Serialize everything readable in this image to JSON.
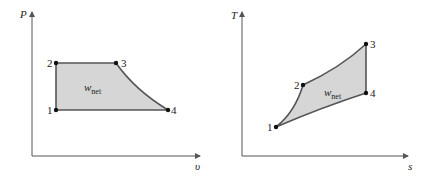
{
  "diagrams": [
    {
      "name": "P-v diagram",
      "y_axis_label": "P",
      "x_axis_label": "υ",
      "area_label": "w",
      "area_label_sub": "net",
      "points": [
        {
          "label": "1"
        },
        {
          "label": "2"
        },
        {
          "label": "3"
        },
        {
          "label": "4"
        }
      ]
    },
    {
      "name": "T-s diagram",
      "y_axis_label": "T",
      "x_axis_label": "s",
      "area_label": "w",
      "area_label_sub": "net",
      "points": [
        {
          "label": "1"
        },
        {
          "label": "2"
        },
        {
          "label": "3"
        },
        {
          "label": "4"
        }
      ]
    }
  ],
  "colors": {
    "fill": "#d6d6d6",
    "line": "#555555",
    "point": "#111111"
  }
}
